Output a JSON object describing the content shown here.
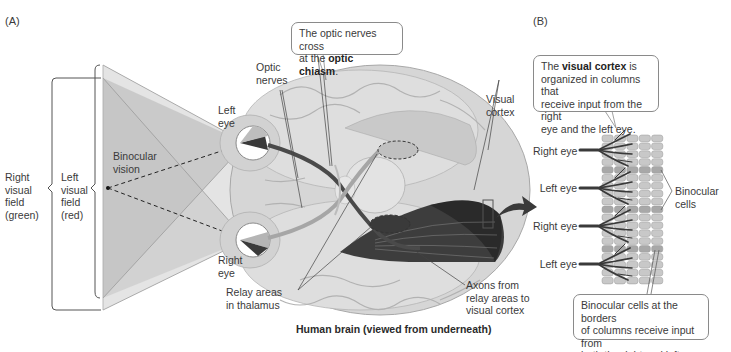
{
  "panels": {
    "a_label": "(A)",
    "b_label": "(B)"
  },
  "panel_a": {
    "labels": {
      "right_visual_field": [
        "Right",
        "visual",
        "field",
        "(green)"
      ],
      "left_visual_field": [
        "Left",
        "visual",
        "field",
        "(red)"
      ],
      "binocular_vision": [
        "Binocular",
        "vision"
      ],
      "left_eye": [
        "Left",
        "eye"
      ],
      "right_eye": [
        "Right",
        "eye"
      ],
      "optic_nerves": [
        "Optic",
        "nerves"
      ],
      "visual_cortex": [
        "Visual",
        "cortex"
      ],
      "relay_areas": [
        "Relay areas",
        "in thalamus"
      ],
      "axons": [
        "Axons from",
        "relay areas to",
        "visual cortex"
      ]
    },
    "callout": {
      "pre": "The optic nerves cross",
      "mid": "at the ",
      "bold": "optic chiasm",
      "post": "."
    },
    "caption": "Human brain (viewed from underneath)"
  },
  "panel_b": {
    "callout_top": {
      "pre": "The ",
      "bold": "visual cortex",
      "post": " is",
      "line2": "organized in columns that",
      "line3": "receive input from the right",
      "line4": "eye and the left eye."
    },
    "eye_labels": [
      "Right eye",
      "Left eye",
      "Right eye",
      "Left eye"
    ],
    "binocular_cells": [
      "Binocular",
      "cells"
    ],
    "callout_bottom": [
      "Binocular cells at the borders",
      "of columns receive input from",
      "both the right and left eyes."
    ],
    "grid": {
      "columns": 5,
      "rows": 19,
      "binocular_rows": [
        4,
        9,
        14
      ]
    }
  },
  "colors": {
    "field_light": "#dcdcdc",
    "field_mid": "#c4c4c4",
    "field_dark": "#b0b0b0",
    "brain": "#d9d9d9",
    "brain_shadow": "#b8b8b8",
    "nerve_dark": "#4a4a4a",
    "cortex_dark": "#3a3a3a",
    "cell": "#c8c8c8",
    "cell_binocular": "#a8a8a8",
    "outline": "#8a8a8a"
  }
}
